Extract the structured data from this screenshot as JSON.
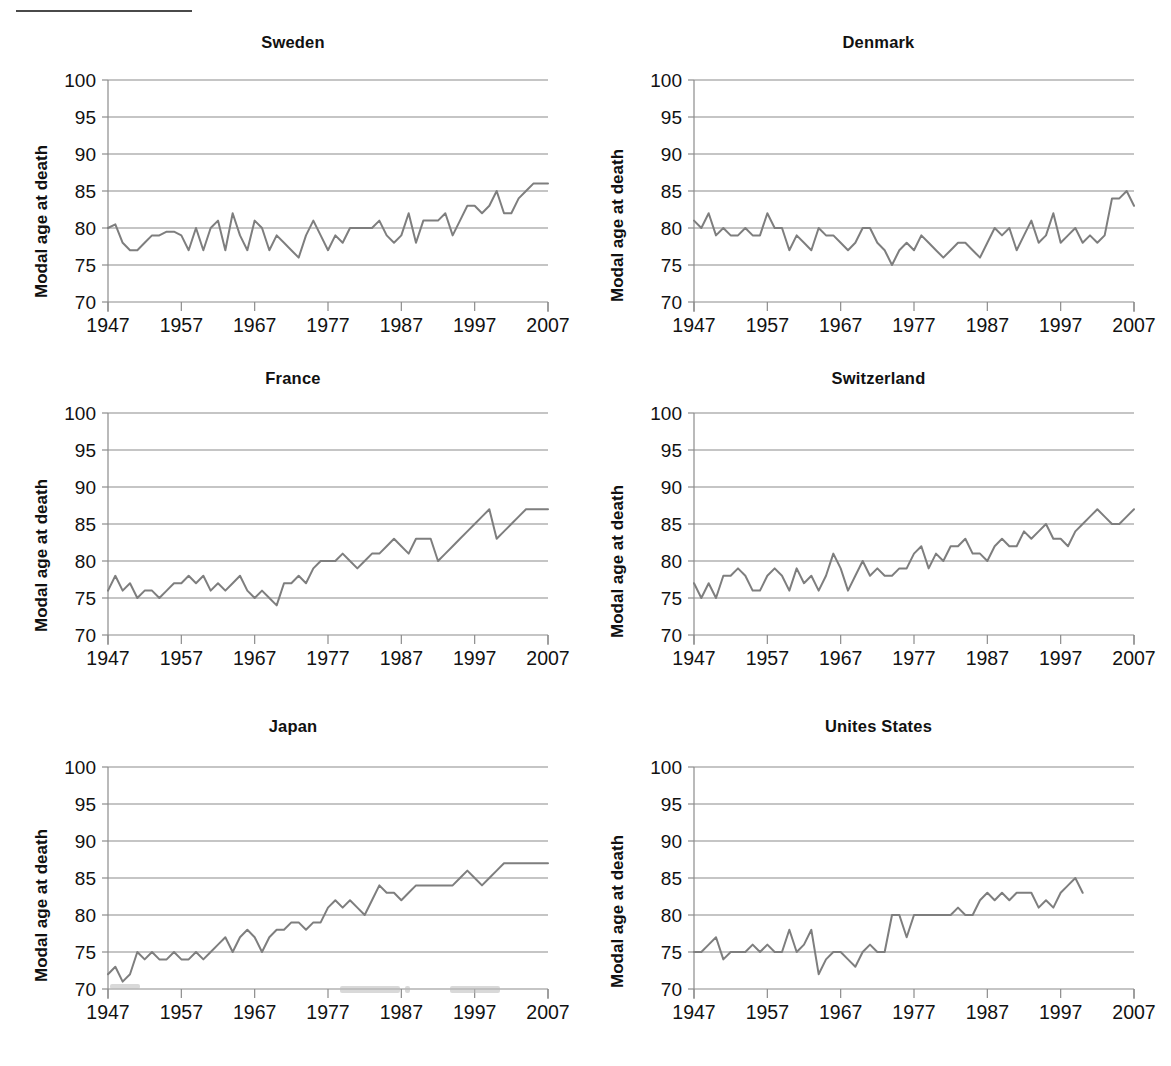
{
  "figure": {
    "axis_label_y": "Modal age at death",
    "axis_label_y_wide": "Modal  age at death",
    "x_ticks": [
      "1947",
      "1957",
      "1967",
      "1977",
      "1987",
      "1997",
      "2007"
    ],
    "y_ticks": [
      "70",
      "75",
      "80",
      "85",
      "90",
      "95",
      "100"
    ],
    "line_color": "#7e7e7e",
    "grid_color": "#8c8c8c",
    "text_color": "#111111"
  },
  "chart_data": [
    {
      "type": "line",
      "title": "Sweden",
      "xlabel": "",
      "ylabel": "Modal age at death",
      "xlim": [
        1947,
        2007
      ],
      "ylim": [
        70,
        100
      ],
      "grid": true,
      "legend": "none",
      "x": [
        1947,
        1948,
        1949,
        1950,
        1951,
        1952,
        1953,
        1954,
        1955,
        1956,
        1957,
        1958,
        1959,
        1960,
        1961,
        1962,
        1963,
        1964,
        1965,
        1966,
        1967,
        1968,
        1969,
        1970,
        1971,
        1972,
        1973,
        1974,
        1975,
        1976,
        1977,
        1978,
        1979,
        1980,
        1981,
        1982,
        1983,
        1984,
        1985,
        1986,
        1987,
        1988,
        1989,
        1990,
        1991,
        1992,
        1993,
        1994,
        1995,
        1996,
        1997,
        1998,
        1999,
        2000,
        2001,
        2002,
        2003,
        2004,
        2005,
        2006,
        2007
      ],
      "values": [
        80,
        80.5,
        78,
        77,
        77,
        78,
        79,
        79,
        79.5,
        79.5,
        79,
        77,
        80,
        77,
        80,
        81,
        77,
        82,
        79,
        77,
        81,
        80,
        77,
        79,
        78,
        77,
        76,
        79,
        81,
        79,
        77,
        79,
        78,
        80,
        80,
        80,
        80,
        81,
        79,
        78,
        79,
        82,
        78,
        81,
        81,
        81,
        82,
        79,
        81,
        83,
        83,
        82,
        83,
        85,
        82,
        82,
        84,
        85,
        86,
        86,
        86
      ]
    },
    {
      "type": "line",
      "title": "Denmark",
      "xlabel": "",
      "ylabel": "Modal  age at death",
      "xlim": [
        1947,
        2007
      ],
      "ylim": [
        70,
        100
      ],
      "grid": true,
      "legend": "none",
      "x": [
        1947,
        1948,
        1949,
        1950,
        1951,
        1952,
        1953,
        1954,
        1955,
        1956,
        1957,
        1958,
        1959,
        1960,
        1961,
        1962,
        1963,
        1964,
        1965,
        1966,
        1967,
        1968,
        1969,
        1970,
        1971,
        1972,
        1973,
        1974,
        1975,
        1976,
        1977,
        1978,
        1979,
        1980,
        1981,
        1982,
        1983,
        1984,
        1985,
        1986,
        1987,
        1988,
        1989,
        1990,
        1991,
        1992,
        1993,
        1994,
        1995,
        1996,
        1997,
        1998,
        1999,
        2000,
        2001,
        2002,
        2003,
        2004,
        2005,
        2006,
        2007
      ],
      "values": [
        81,
        80,
        82,
        79,
        80,
        79,
        79,
        80,
        79,
        79,
        82,
        80,
        80,
        77,
        79,
        78,
        77,
        80,
        79,
        79,
        78,
        77,
        78,
        80,
        80,
        78,
        77,
        75,
        77,
        78,
        77,
        79,
        78,
        77,
        76,
        77,
        78,
        78,
        77,
        76,
        78,
        80,
        79,
        80,
        77,
        79,
        81,
        78,
        79,
        82,
        78,
        79,
        80,
        78,
        79,
        78,
        79,
        84,
        84,
        85,
        83
      ]
    },
    {
      "type": "line",
      "title": "France",
      "xlabel": "",
      "ylabel": "Modal age at death",
      "xlim": [
        1947,
        2007
      ],
      "ylim": [
        70,
        100
      ],
      "grid": true,
      "legend": "none",
      "x": [
        1947,
        1948,
        1949,
        1950,
        1951,
        1952,
        1953,
        1954,
        1955,
        1956,
        1957,
        1958,
        1959,
        1960,
        1961,
        1962,
        1963,
        1964,
        1965,
        1966,
        1967,
        1968,
        1969,
        1970,
        1971,
        1972,
        1973,
        1974,
        1975,
        1976,
        1977,
        1978,
        1979,
        1980,
        1981,
        1982,
        1983,
        1984,
        1985,
        1986,
        1987,
        1988,
        1989,
        1990,
        1991,
        1992,
        1993,
        1994,
        1995,
        1996,
        1997,
        1998,
        1999,
        2000,
        2001,
        2002,
        2003,
        2004,
        2005,
        2006,
        2007
      ],
      "values": [
        76,
        78,
        76,
        77,
        75,
        76,
        76,
        75,
        76,
        77,
        77,
        78,
        77,
        78,
        76,
        77,
        76,
        77,
        78,
        76,
        75,
        76,
        75,
        74,
        77,
        77,
        78,
        77,
        79,
        80,
        80,
        80,
        81,
        80,
        79,
        80,
        81,
        81,
        82,
        83,
        82,
        81,
        83,
        83,
        83,
        80,
        81,
        82,
        83,
        84,
        85,
        86,
        87,
        83,
        84,
        85,
        86,
        87,
        87,
        87,
        87
      ]
    },
    {
      "type": "line",
      "title": "Switzerland",
      "xlabel": "",
      "ylabel": "Modal  age at death",
      "xlim": [
        1947,
        2007
      ],
      "ylim": [
        70,
        100
      ],
      "grid": true,
      "legend": "none",
      "x": [
        1947,
        1948,
        1949,
        1950,
        1951,
        1952,
        1953,
        1954,
        1955,
        1956,
        1957,
        1958,
        1959,
        1960,
        1961,
        1962,
        1963,
        1964,
        1965,
        1966,
        1967,
        1968,
        1969,
        1970,
        1971,
        1972,
        1973,
        1974,
        1975,
        1976,
        1977,
        1978,
        1979,
        1980,
        1981,
        1982,
        1983,
        1984,
        1985,
        1986,
        1987,
        1988,
        1989,
        1990,
        1991,
        1992,
        1993,
        1994,
        1995,
        1996,
        1997,
        1998,
        1999,
        2000,
        2001,
        2002,
        2003,
        2004,
        2005,
        2006,
        2007
      ],
      "values": [
        77,
        75,
        77,
        75,
        78,
        78,
        79,
        78,
        76,
        76,
        78,
        79,
        78,
        76,
        79,
        77,
        78,
        76,
        78,
        81,
        79,
        76,
        78,
        80,
        78,
        79,
        78,
        78,
        79,
        79,
        81,
        82,
        79,
        81,
        80,
        82,
        82,
        83,
        81,
        81,
        80,
        82,
        83,
        82,
        82,
        84,
        83,
        84,
        85,
        83,
        83,
        82,
        84,
        85,
        86,
        87,
        86,
        85,
        85,
        86,
        87
      ]
    },
    {
      "type": "line",
      "title": "Japan",
      "xlabel": "",
      "ylabel": "Modal age at death",
      "xlim": [
        1947,
        2007
      ],
      "ylim": [
        70,
        100
      ],
      "grid": true,
      "legend": "none",
      "x": [
        1947,
        1948,
        1949,
        1950,
        1951,
        1952,
        1953,
        1954,
        1955,
        1956,
        1957,
        1958,
        1959,
        1960,
        1961,
        1962,
        1963,
        1964,
        1965,
        1966,
        1967,
        1968,
        1969,
        1970,
        1971,
        1972,
        1973,
        1974,
        1975,
        1976,
        1977,
        1978,
        1979,
        1980,
        1981,
        1982,
        1983,
        1984,
        1985,
        1986,
        1987,
        1988,
        1989,
        1990,
        1991,
        1992,
        1993,
        1994,
        1995,
        1996,
        1997,
        1998,
        1999,
        2000,
        2001,
        2002,
        2003,
        2004,
        2005,
        2006,
        2007
      ],
      "values": [
        72,
        73,
        71,
        72,
        75,
        74,
        75,
        74,
        74,
        75,
        74,
        74,
        75,
        74,
        75,
        76,
        77,
        75,
        77,
        78,
        77,
        75,
        77,
        78,
        78,
        79,
        79,
        78,
        79,
        79,
        81,
        82,
        81,
        82,
        81,
        80,
        82,
        84,
        83,
        83,
        82,
        83,
        84,
        84,
        84,
        84,
        84,
        84,
        85,
        86,
        85,
        84,
        85,
        86,
        87,
        87,
        87,
        87,
        87,
        87,
        87
      ]
    },
    {
      "type": "line",
      "title": "Unites States",
      "xlabel": "",
      "ylabel": "Modal  age at death",
      "xlim": [
        1947,
        2007
      ],
      "ylim": [
        70,
        100
      ],
      "grid": true,
      "legend": "none",
      "x": [
        1947,
        1948,
        1949,
        1950,
        1951,
        1952,
        1953,
        1954,
        1955,
        1956,
        1957,
        1958,
        1959,
        1960,
        1961,
        1962,
        1963,
        1964,
        1965,
        1966,
        1967,
        1968,
        1969,
        1970,
        1971,
        1972,
        1973,
        1974,
        1975,
        1976,
        1977,
        1978,
        1979,
        1980,
        1981,
        1982,
        1983,
        1984,
        1985,
        1986,
        1987,
        1988,
        1989,
        1990,
        1991,
        1992,
        1993,
        1994,
        1995,
        1996,
        1997,
        1998,
        1999,
        2000,
        2001,
        2002,
        2003,
        2004,
        2005,
        2006,
        2007
      ],
      "values": [
        75,
        75,
        76,
        77,
        74,
        75,
        75,
        75,
        76,
        75,
        76,
        75,
        75,
        78,
        75,
        76,
        78,
        72,
        74,
        75,
        75,
        74,
        73,
        75,
        76,
        75,
        75,
        80,
        80,
        77,
        80,
        80,
        80,
        80,
        80,
        80,
        81,
        80,
        80,
        82,
        83,
        82,
        83,
        82,
        83,
        83,
        83,
        81,
        82,
        81,
        83,
        84,
        85,
        83
      ]
    }
  ]
}
